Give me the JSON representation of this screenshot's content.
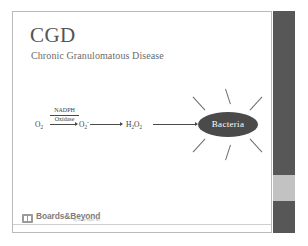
{
  "slide": {
    "title": "CGD",
    "subtitle": "Chronic Granulomatous Disease",
    "background_color": "#ffffff",
    "border_color": "#b9b9b9"
  },
  "diagram": {
    "type": "reaction-pathway",
    "reactant_1": "O₂",
    "enzyme_top": "NADPH",
    "enzyme_bottom": "Oxidase",
    "intermediate": "O₂⁻",
    "product": "H₂O₂",
    "target_label": "Bacteria",
    "target_fill": "#4a4a4a",
    "target_text_color": "#ffffff",
    "ray_count": 6,
    "arrow_color": "#4a4a4a",
    "species": [
      {
        "name": "oxygen",
        "formula": "O",
        "sub": "2",
        "sup": ""
      },
      {
        "name": "superoxide",
        "formula": "O",
        "sub": "2",
        "sup": "-"
      },
      {
        "name": "hydrogen-peroxide",
        "formula": "H",
        "sub": "2",
        "sup": ""
      }
    ]
  },
  "footer": {
    "brand_name": "Boards&Beyond",
    "brand_tagline": "by Jason Ryan, MD",
    "divider_color": "#cfcfcf"
  },
  "scrollbar": {
    "track_color": "#575757",
    "thumb_color": "#c2c2c2",
    "thumb_position_percent": 74
  }
}
